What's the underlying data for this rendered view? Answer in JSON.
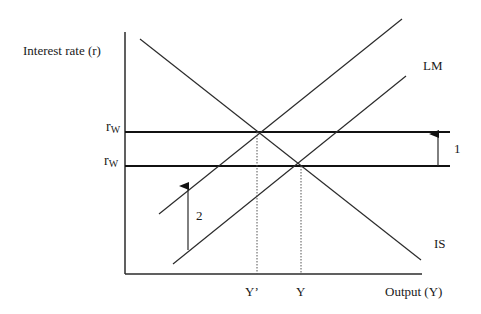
{
  "diagram": {
    "type": "IS-LM",
    "y_axis_label": "Interest rate (r)",
    "x_axis_label": "Output (Y)",
    "curves": {
      "lm_label": "LM",
      "is_label": "IS"
    },
    "interest_levels": [
      {
        "symbol": "r",
        "subscript": "W",
        "position": "upper"
      },
      {
        "symbol": "r",
        "subscript": "W",
        "position": "lower"
      }
    ],
    "output_ticks": [
      {
        "label": "Y’"
      },
      {
        "label": "Y"
      }
    ],
    "arrows": [
      {
        "label": "1",
        "description": "world interest rate shifts up"
      },
      {
        "label": "2",
        "description": "LM shifts up/left"
      }
    ],
    "colors": {
      "line": "#2b2b2b",
      "text": "#1a1a1a",
      "background": "#ffffff"
    }
  }
}
